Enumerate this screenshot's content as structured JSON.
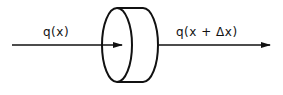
{
  "diagram": {
    "type": "flow-through-disk",
    "stroke_color": "#111111",
    "background": "#ffffff",
    "input_label": "q(x)",
    "output_label": "q(x + Δx)",
    "elements": [
      {
        "id": "input-arrow",
        "kind": "arrow",
        "from": [
          12,
          45
        ],
        "to": [
          122,
          45
        ],
        "label": "q(x)"
      },
      {
        "id": "disk",
        "kind": "cylinder-slice",
        "front_ellipse": {
          "cx": 117,
          "cy": 45,
          "rx": 15,
          "ry": 37
        },
        "depth": 26
      },
      {
        "id": "output-arrow",
        "kind": "arrow",
        "from": [
          160,
          45
        ],
        "to": [
          270,
          45
        ],
        "label": "q(x + Δx)"
      }
    ]
  }
}
